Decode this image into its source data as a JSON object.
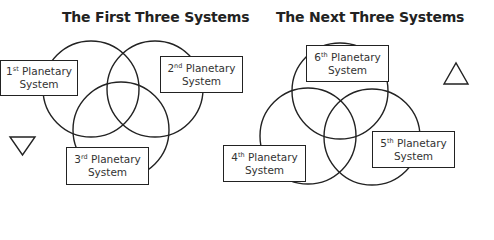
{
  "left_panel": {
    "title": "The First Three Systems",
    "systems": [
      {
        "num": "1",
        "suffix": "st",
        "line1": "Planetary",
        "line2": "System"
      },
      {
        "num": "2",
        "suffix": "nd",
        "line1": "Planetary",
        "line2": "System"
      },
      {
        "num": "3",
        "suffix": "rd",
        "line1": "Planetary",
        "line2": "System"
      }
    ],
    "marker": "down-triangle"
  },
  "right_panel": {
    "title": "The Next Three Systems",
    "systems": [
      {
        "num": "4",
        "suffix": "th",
        "line1": "Planetary",
        "line2": "System"
      },
      {
        "num": "5",
        "suffix": "th",
        "line1": "Planetary",
        "line2": "System"
      },
      {
        "num": "6",
        "suffix": "th",
        "line1": "Planetary",
        "line2": "System"
      }
    ],
    "marker": "up-triangle"
  },
  "colors": {
    "stroke": "#222222",
    "background": "#ffffff"
  }
}
